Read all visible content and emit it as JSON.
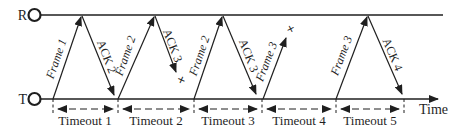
{
  "diagram": {
    "endpoints": {
      "receiver": "R",
      "transmitter": "T"
    },
    "time_axis_label": "Time",
    "lost_marker": "×",
    "colors": {
      "line": "#1f1f1f",
      "background": "#ffffff"
    },
    "frames": [
      {
        "label": "Frame 1",
        "direction": "T-to-R",
        "status": "delivered"
      },
      {
        "label": "Frame 2",
        "direction": "T-to-R",
        "status": "delivered"
      },
      {
        "label": "Frame 2",
        "direction": "T-to-R",
        "status": "delivered",
        "retransmission": true
      },
      {
        "label": "Frame 3",
        "direction": "T-to-R",
        "status": "lost"
      },
      {
        "label": "Frame 3",
        "direction": "T-to-R",
        "status": "delivered",
        "retransmission": true
      }
    ],
    "acks": [
      {
        "label": "ACK 2",
        "direction": "R-to-T",
        "status": "delivered"
      },
      {
        "label": "ACK 3",
        "direction": "R-to-T",
        "status": "lost"
      },
      {
        "label": "ACK 3",
        "direction": "R-to-T",
        "status": "delivered"
      },
      {
        "label": "ACK 4",
        "direction": "R-to-T",
        "status": "delivered"
      }
    ],
    "timeouts": [
      "Timeout 1",
      "Timeout 2",
      "Timeout 3",
      "Timeout 4",
      "Timeout 5"
    ]
  }
}
